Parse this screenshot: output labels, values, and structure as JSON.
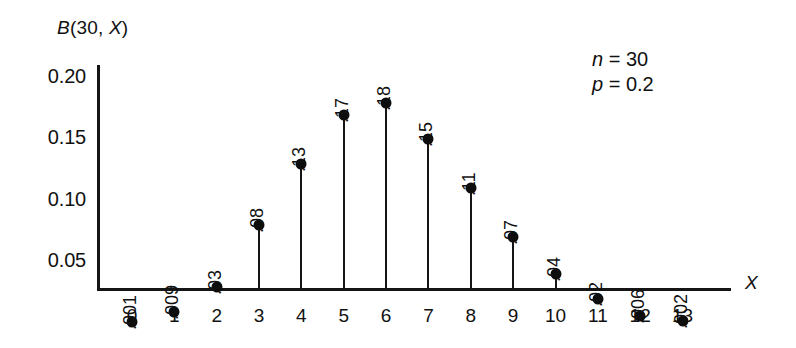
{
  "chart_data": {
    "type": "bar",
    "subtype": "stem-plot",
    "title": "B(30, X)",
    "xlabel": "X",
    "ylabel": "B(30, X)",
    "categories": [
      "0",
      "1",
      "2",
      "3",
      "4",
      "5",
      "6",
      "7",
      "8",
      "9",
      "10",
      "11",
      "12",
      "13"
    ],
    "values": [
      0.001,
      0.009,
      0.03,
      0.08,
      0.13,
      0.17,
      0.18,
      0.15,
      0.11,
      0.07,
      0.04,
      0.02,
      0.006,
      0.002
    ],
    "point_labels": [
      ".001",
      ".009",
      ".03",
      ".08",
      ".13",
      ".17",
      ".18",
      ".15",
      ".11",
      ".07",
      ".04",
      ".02",
      ".006",
      ".002"
    ],
    "xlim": [
      0,
      13
    ],
    "ylim": [
      0.027,
      0.215
    ],
    "y_ticks": [
      0.05,
      0.1,
      0.15,
      0.2
    ],
    "y_tick_labels": [
      "0.05",
      "0.10",
      "0.15",
      "0.20"
    ],
    "x_tick_labels": [
      "0",
      "1",
      "2",
      "3",
      "4",
      "5",
      "6",
      "7",
      "8",
      "9",
      "10",
      "11",
      "12",
      "13"
    ],
    "grid": false,
    "legend": null,
    "annotations": [
      {
        "symbol": "n",
        "equals": "=",
        "value": "30"
      },
      {
        "symbol": "p",
        "equals": "=",
        "value": "0.2"
      }
    ],
    "colors": {
      "line": "#151515",
      "marker": "#0d0d0d",
      "background": "#ffffff",
      "text": "#111111"
    }
  },
  "axis_title": {
    "y_prefix": "B",
    "y_body": "(30, ",
    "y_var": "X",
    "y_suffix": ")",
    "x": "X"
  }
}
